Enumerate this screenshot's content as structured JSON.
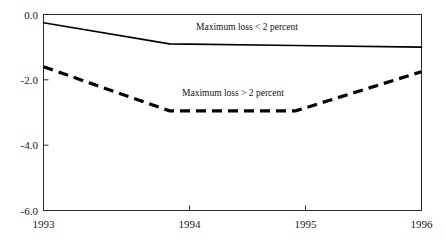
{
  "chart_data": {
    "type": "line",
    "title": "",
    "subtitle": "",
    "xlabel": "",
    "ylabel": "",
    "x": [
      1993,
      1994,
      1995,
      1996
    ],
    "categories": [
      "1993",
      "1994",
      "1995",
      "1996"
    ],
    "xtick_labels": [
      "1993",
      "1994",
      "1995",
      "1996"
    ],
    "ytick_labels": [
      "0.0",
      "-2.0",
      "-4.0",
      "-6.0"
    ],
    "ytick_values": [
      0.0,
      -2.0,
      -4.0,
      -6.0
    ],
    "xlim": [
      1993,
      1996
    ],
    "ylim": [
      -6.0,
      0.0
    ],
    "grid": false,
    "legend_position": "inline-annotations",
    "series": [
      {
        "name": "Maximum loss < 2 percent",
        "style": "solid",
        "color": "#000000",
        "values": [
          -0.25,
          -0.9,
          -0.95,
          -1.0
        ]
      },
      {
        "name": "Maximum loss > 2 percent",
        "style": "dashed",
        "color": "#000000",
        "values": [
          -1.6,
          -2.95,
          -2.95,
          -1.75
        ]
      }
    ],
    "annotations": [
      {
        "text": "Maximum loss < 2 percent",
        "x": 1994.05,
        "y": -0.25
      },
      {
        "text": "Maximum loss > 2 percent",
        "x": 1993.9,
        "y": -2.35
      }
    ]
  },
  "axis": {
    "ytick_0": "0.0",
    "ytick_1": "-2.0",
    "ytick_2": "-4.0",
    "ytick_3": "-6.0",
    "xtick_0": "1993",
    "xtick_1": "1994",
    "xtick_2": "1995",
    "xtick_3": "1996"
  },
  "labels": {
    "series_low": "Maximum loss < 2 percent",
    "series_high": "Maximum loss > 2 percent"
  },
  "colors": {
    "ink": "#000000",
    "axis": "#2b2b2b",
    "background": "#ffffff"
  }
}
